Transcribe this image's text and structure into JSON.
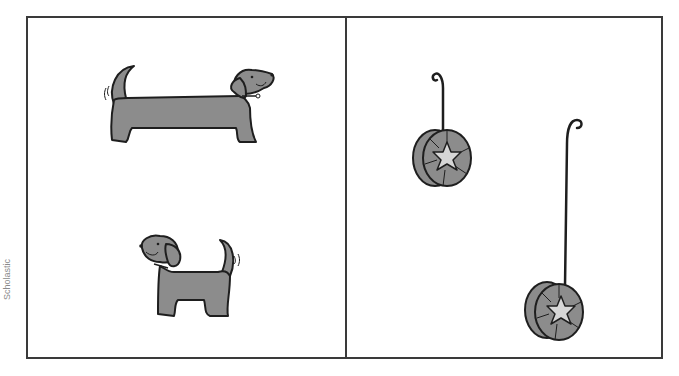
{
  "credit": {
    "text": "Scholastic"
  },
  "panels": [
    {
      "id": "left",
      "items": [
        {
          "name": "long-dog",
          "description": "long dachshund dog facing right"
        },
        {
          "name": "short-dog",
          "description": "short dog facing left"
        }
      ]
    },
    {
      "id": "right",
      "items": [
        {
          "name": "yoyo-short-string",
          "description": "yo-yo with short string"
        },
        {
          "name": "yoyo-long-string",
          "description": "yo-yo with long string"
        }
      ]
    }
  ],
  "colors": {
    "frame": "#3a3a3a",
    "fill_gray": "#8c8c8c",
    "star_fill": "#d6d6d6",
    "outline": "#1e1e1e"
  }
}
